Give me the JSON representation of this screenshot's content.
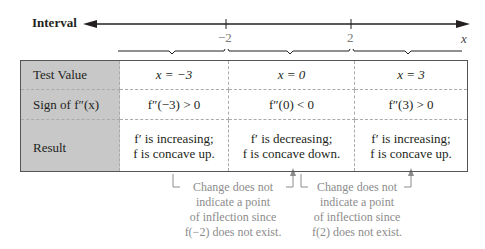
{
  "axis": {
    "label": "Interval",
    "ticks": [
      {
        "label": "−2",
        "x": 226
      },
      {
        "label": "2",
        "x": 351
      }
    ],
    "variable": "x"
  },
  "table": {
    "rows": [
      {
        "header": "Test Value",
        "cells": [
          "x = −3",
          "x = 0",
          "x = 3"
        ]
      },
      {
        "header": "Sign of f″(x)",
        "cells": [
          "f″(−3) > 0",
          "f″(0) < 0",
          "f″(3) > 0"
        ]
      },
      {
        "header": "Result",
        "cells": [
          {
            "line1": "f′ is increasing;",
            "line2": "f is concave up."
          },
          {
            "line1": "f′ is decreasing;",
            "line2": "f is concave down."
          },
          {
            "line1": "f′ is increasing;",
            "line2": "f is concave up."
          }
        ]
      }
    ]
  },
  "notes": [
    {
      "lines": [
        "Change does not",
        "indicate a point",
        "of inflection since",
        "f(−2) does not exist."
      ]
    },
    {
      "lines": [
        "Change does not",
        "indicate a point",
        "of inflection since",
        "f(2) does not exist."
      ]
    }
  ],
  "colors": {
    "header_bg": "#c8c8c8",
    "note_text": "#8c8c8c",
    "border": "#555555"
  }
}
